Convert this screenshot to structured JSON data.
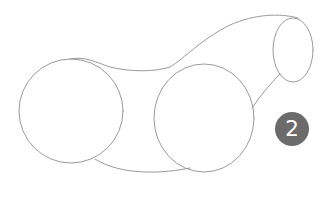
{
  "step": {
    "number": "2",
    "badge_color": "#6b6b6b"
  },
  "sketch": {
    "stroke_color": "#9a9a9a",
    "description": "Pencil sketch of two large circles and a small ellipse connected by curved outlines"
  }
}
